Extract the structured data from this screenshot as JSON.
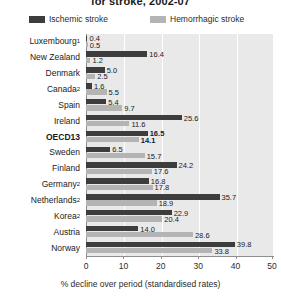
{
  "title": "for stroke, 2002-07",
  "legend": {
    "position": "top",
    "entries": [
      {
        "label": "Ischemic stroke",
        "color": "#3d3d3d",
        "icon": "legend-swatch-icon"
      },
      {
        "label": "Hemorrhagic stroke",
        "color": "#b4b4b4",
        "icon": "legend-swatch-icon"
      }
    ]
  },
  "axis": {
    "xlabel": "% decline over period (standardised rates)",
    "ticks": [
      "0",
      "10",
      "20",
      "30",
      "40",
      "50"
    ]
  },
  "colors": {
    "ischemic": "#3d3d3d",
    "hemorrhagic": "#b4b4b4",
    "plot_background": "#e9e9e9",
    "gridline": "#ffffff",
    "axis": "#8e8e8e",
    "text": "#1a1a1a"
  },
  "chart_data": {
    "type": "bar",
    "orientation": "horizontal",
    "title": "for stroke, 2002-07",
    "xlabel": "% decline over period (standardised rates)",
    "ylabel": "",
    "xlim": [
      0,
      50
    ],
    "xticks": [
      0,
      10,
      20,
      30,
      40,
      50
    ],
    "grid": true,
    "legend_position": "top",
    "categories": [
      "Luxembourg",
      "New Zealand",
      "Denmark",
      "Canada",
      "Spain",
      "Ireland",
      "OECD13",
      "Sweden",
      "Finland",
      "Germany",
      "Netherlands",
      "Korea",
      "Austria",
      "Norway"
    ],
    "category_footnotes": {
      "Luxembourg": "1",
      "Canada": "2",
      "Germany": "2",
      "Netherlands": "2",
      "Korea": "2"
    },
    "highlighted_category": "OECD13",
    "series": [
      {
        "name": "Ischemic stroke",
        "color": "#3d3d3d",
        "values": [
          0.4,
          16.4,
          5.0,
          1.6,
          5.4,
          25.6,
          16.5,
          6.5,
          24.2,
          16.8,
          35.7,
          22.9,
          14.0,
          39.8
        ]
      },
      {
        "name": "Hemorrhagic stroke",
        "color": "#b4b4b4",
        "values": [
          0.5,
          1.2,
          2.5,
          5.5,
          9.7,
          11.6,
          14.1,
          15.7,
          17.6,
          17.8,
          18.9,
          20.4,
          28.6,
          33.8
        ]
      }
    ]
  }
}
